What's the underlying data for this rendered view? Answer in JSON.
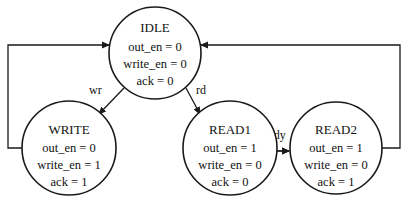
{
  "diagram": {
    "type": "state-machine",
    "colors": {
      "stroke": "#1a1a1a",
      "text": "#111111",
      "background": "#ffffff"
    },
    "states": [
      {
        "id": "IDLE",
        "name": "IDLE",
        "outputs": [
          "out_en = 0",
          "write_en = 0",
          "ack = 0"
        ]
      },
      {
        "id": "WRITE",
        "name": "WRITE",
        "outputs": [
          "out_en = 0",
          "write_en = 1",
          "ack = 1"
        ]
      },
      {
        "id": "READ1",
        "name": "READ1",
        "outputs": [
          "out_en = 1",
          "write_en = 0",
          "ack = 0"
        ]
      },
      {
        "id": "READ2",
        "name": "READ2",
        "outputs": [
          "out_en = 1",
          "write_en = 0",
          "ack = 1"
        ]
      }
    ],
    "transitions": [
      {
        "from": "IDLE",
        "to": "WRITE",
        "label": "wr"
      },
      {
        "from": "IDLE",
        "to": "READ1",
        "label": "rd"
      },
      {
        "from": "READ1",
        "to": "READ2",
        "label": "ready"
      },
      {
        "from": "WRITE",
        "to": "IDLE",
        "label": ""
      },
      {
        "from": "READ2",
        "to": "IDLE",
        "label": ""
      }
    ]
  }
}
